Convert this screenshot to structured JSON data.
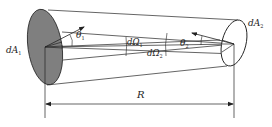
{
  "diagram": {
    "type": "radiation-view-factor-geometry",
    "labels": {
      "dA1": {
        "main": "dA",
        "sub": "1"
      },
      "dA2": {
        "main": "dA",
        "sub": "2"
      },
      "theta1": {
        "main": "θ",
        "sub": "1"
      },
      "theta2": {
        "main": "θ",
        "sub": "2"
      },
      "dOmega1": {
        "main": "dΩ",
        "sub": "1"
      },
      "dOmega2": {
        "main": "dΩ",
        "sub": "2"
      },
      "distance": "R"
    },
    "colors": {
      "line": "#222222",
      "surface1_fill": "#7f7f7f",
      "surface2_fill": "#ffffff",
      "background": "#ffffff"
    },
    "elements": [
      {
        "id": "surface-1",
        "desc": "shaded elliptical area element dA1 on left"
      },
      {
        "id": "surface-2",
        "desc": "unshaded elliptical area element dA2 on right"
      },
      {
        "id": "normal-1",
        "desc": "normal vector from dA1 with angle θ1"
      },
      {
        "id": "normal-2",
        "desc": "normal vector from dA2 with angle θ2"
      },
      {
        "id": "cone-1",
        "desc": "solid angle dΩ1 subtended from dA1"
      },
      {
        "id": "cone-2",
        "desc": "solid angle dΩ2 subtended from dA2"
      },
      {
        "id": "distance-arrow",
        "desc": "double-headed dimension arrow R between centers"
      }
    ]
  }
}
